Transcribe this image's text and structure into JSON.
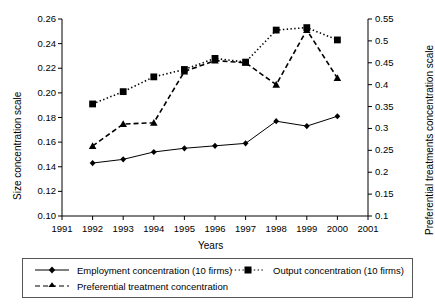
{
  "chart_data": {
    "type": "line",
    "title": "",
    "xlabel": "Years",
    "ylabel": "Size concentration scale",
    "y2label": "Preferential treatments concentration scale",
    "x": [
      1992,
      1993,
      1994,
      1995,
      1996,
      1997,
      1998,
      1999,
      2000
    ],
    "xlim": [
      1991,
      2001
    ],
    "xticks": [
      "1991",
      "1992",
      "1993",
      "1994",
      "1995",
      "1996",
      "1997",
      "1998",
      "1999",
      "2000",
      "2001"
    ],
    "ylim": [
      0.1,
      0.26
    ],
    "yticks": [
      "0.10",
      "0.12",
      "0.14",
      "0.16",
      "0.18",
      "0.20",
      "0.22",
      "0.24",
      "0.26"
    ],
    "y2lim": [
      0.1,
      0.55
    ],
    "y2ticks": [
      "0.1",
      "0.15",
      "0.2",
      "0.25",
      "0.3",
      "0.35",
      "0.4",
      "0.45",
      "0.5",
      "0.55"
    ],
    "grid": false,
    "legend_position": "bottom",
    "series": [
      {
        "name": "Employment concentration (10 firms)",
        "axis": "left",
        "marker": "diamond",
        "line": "solid",
        "color": "#000000",
        "values": [
          0.143,
          0.146,
          0.152,
          0.155,
          0.157,
          0.159,
          0.177,
          0.173,
          0.181
        ]
      },
      {
        "name": "Output concentration (10 firms)",
        "axis": "left",
        "marker": "square",
        "line": "dotted",
        "color": "#000000",
        "values": [
          0.191,
          0.201,
          0.213,
          0.219,
          0.228,
          0.225,
          0.251,
          0.253,
          0.243
        ]
      },
      {
        "name": "Preferential treatment concentration",
        "axis": "right",
        "marker": "triangle",
        "line": "dashed",
        "color": "#000000",
        "values": [
          0.26,
          0.31,
          0.313,
          0.43,
          0.455,
          0.45,
          0.4,
          0.525,
          0.415
        ]
      }
    ]
  },
  "axes": {
    "left_title": "Size concentration scale",
    "right_title": "Preferential treatments concentration scale",
    "x_title": "Years"
  },
  "legend": {
    "items": [
      {
        "label": "Employment concentration (10 firms)"
      },
      {
        "label": "Output concentration (10 firms)"
      },
      {
        "label": "Preferential treatment concentration"
      }
    ]
  }
}
